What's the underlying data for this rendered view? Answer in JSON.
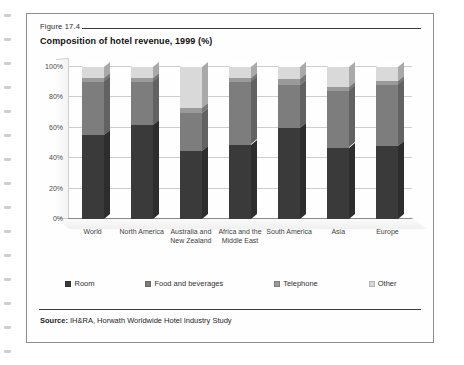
{
  "figure": {
    "number": "Figure 17.4",
    "title": "Composition of hotel revenue, 1999 (%)",
    "source_label": "Source:",
    "source_text": "IH&RA, Horwath Worldwide Hotel Industry Study"
  },
  "colors": {
    "room": "#3a3a3a",
    "food_and_beverages": "#7d7d7d",
    "telephone": "#9a9a9a",
    "other": "#d9d9d9",
    "gridline": "#cdcdcd",
    "axis": "#8a8a8a"
  },
  "chart_data": {
    "type": "bar",
    "title": "Composition of hotel revenue, 1999 (%)",
    "xlabel": "",
    "ylabel": "",
    "ylim": [
      0,
      100
    ],
    "yticks": [
      "0%",
      "20%",
      "40%",
      "60%",
      "80%",
      "100%"
    ],
    "grid": true,
    "stacked": true,
    "legend_position": "bottom",
    "categories": [
      "World",
      "North America",
      "Australia and New Zealand",
      "Africa and the Middle East",
      "South America",
      "Asia",
      "Europe"
    ],
    "series": [
      {
        "name": "Room",
        "values": [
          55,
          62,
          45,
          49,
          60,
          47,
          48
        ]
      },
      {
        "name": "Food and beverages",
        "values": [
          35,
          28,
          25,
          41,
          28,
          37,
          40
        ]
      },
      {
        "name": "Telephone",
        "values": [
          3,
          3,
          3,
          3,
          4,
          3,
          3
        ]
      },
      {
        "name": "Other",
        "values": [
          7,
          7,
          27,
          7,
          8,
          13,
          9
        ]
      }
    ]
  }
}
